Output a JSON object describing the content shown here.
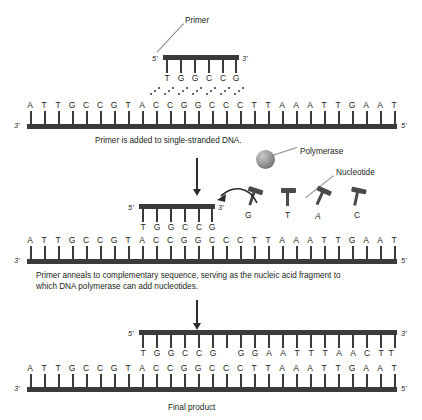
{
  "figure": {
    "background": "#ffffff",
    "ink": "#231f20",
    "strand_color": "#3a3a3a"
  },
  "panel1": {
    "primer": {
      "label": "Primer",
      "five_prime": "5'",
      "three_prime": "3'",
      "bases": [
        "T",
        "G",
        "G",
        "C",
        "C",
        "G"
      ]
    },
    "template": {
      "three_prime": "3'",
      "five_prime": "5'",
      "bases": [
        "A",
        "T",
        "T",
        "G",
        "C",
        "C",
        "G",
        "T",
        "A",
        "C",
        "C",
        "G",
        "G",
        "C",
        "C",
        "C",
        "T",
        "T",
        "A",
        "A",
        "A",
        "T",
        "T",
        "G",
        "A",
        "A",
        "T"
      ]
    },
    "caption": "Primer is added to single-stranded DNA."
  },
  "panel2": {
    "polymerase_label": "Polymerase",
    "nucleotide_label": "Nucleotide",
    "free_nucleotides": [
      "G",
      "T",
      "A",
      "C"
    ],
    "primer": {
      "five_prime": "5'",
      "three_prime": "3'",
      "bases": [
        "T",
        "G",
        "G",
        "C",
        "C",
        "G"
      ]
    },
    "template": {
      "three_prime": "3'",
      "five_prime": "5'",
      "bases": [
        "A",
        "T",
        "T",
        "G",
        "C",
        "C",
        "G",
        "T",
        "A",
        "C",
        "C",
        "G",
        "G",
        "C",
        "C",
        "C",
        "T",
        "T",
        "A",
        "A",
        "A",
        "T",
        "T",
        "G",
        "A",
        "A",
        "T"
      ]
    },
    "caption_line1": "Primer anneals to complementary sequence, serving as the nucleic acid fragment to",
    "caption_line2": "which DNA polymerase can add nucleotides."
  },
  "panel3": {
    "new_strand": {
      "five_prime": "5'",
      "three_prime": "3'",
      "bases": [
        "T",
        "G",
        "G",
        "C",
        "C",
        "G",
        "",
        "G",
        "G",
        "A",
        "A",
        "T",
        "T",
        "T",
        "A",
        "A",
        "C",
        "T",
        "T",
        "A"
      ]
    },
    "template": {
      "three_prime": "3'",
      "five_prime": "5'",
      "bases": [
        "A",
        "T",
        "T",
        "G",
        "C",
        "C",
        "G",
        "T",
        "A",
        "C",
        "C",
        "G",
        "G",
        "C",
        "C",
        "C",
        "T",
        "T",
        "A",
        "A",
        "A",
        "T",
        "T",
        "G",
        "A",
        "A",
        "T"
      ]
    },
    "caption": "Final product"
  }
}
